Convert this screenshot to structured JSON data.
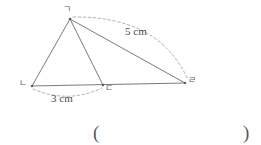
{
  "figure": {
    "type": "geometry-diagram",
    "stroke_color": "#6b6b6b",
    "dash_color": "#9a9a9a",
    "background": "#ffffff",
    "width": 261,
    "height": 145,
    "vertices": [
      {
        "id": "apex",
        "label": "ㄱ",
        "x": 70,
        "y": 19,
        "label_x": 63,
        "label_y": 5
      },
      {
        "id": "base-left",
        "label": "ㄴ",
        "x": 32,
        "y": 86,
        "label_x": 19,
        "label_y": 79
      },
      {
        "id": "base-mid",
        "label": "ㄷ",
        "x": 103,
        "y": 85,
        "label_x": 105,
        "label_y": 84
      },
      {
        "id": "base-right",
        "label": "ㄹ",
        "x": 185,
        "y": 83,
        "label_x": 188,
        "label_y": 76
      }
    ],
    "segments": [
      {
        "id": "seg-apex-left",
        "from": "apex",
        "to": "base-left",
        "style": "solid"
      },
      {
        "id": "seg-apex-mid",
        "from": "apex",
        "to": "base-mid",
        "style": "solid"
      },
      {
        "id": "seg-apex-right",
        "from": "apex",
        "to": "base-right",
        "style": "solid"
      },
      {
        "id": "seg-base",
        "from": "base-left",
        "to": "base-right",
        "style": "solid"
      }
    ],
    "measurements": [
      {
        "id": "measure-5cm",
        "label": "5 cm",
        "from": "apex",
        "to": "base-right",
        "arc_side": "outer",
        "label_x": 125,
        "label_y": 26
      },
      {
        "id": "measure-3cm",
        "label": "3 cm",
        "from": "base-left",
        "to": "base-mid",
        "arc_side": "below",
        "label_x": 51,
        "label_y": 93
      }
    ]
  },
  "answer": {
    "open_paren": "(",
    "close_paren": ")",
    "value": "",
    "open_x": 93,
    "close_x": 243,
    "y": 123
  }
}
